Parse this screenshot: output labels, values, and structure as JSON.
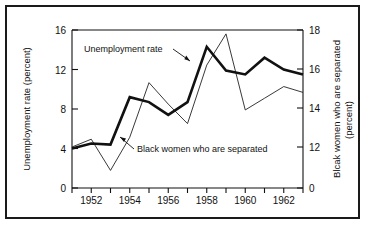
{
  "figure": {
    "background_color": "#ffffff",
    "frame_color": "#1a1a1a"
  },
  "chart_data": {
    "type": "line",
    "title": "",
    "xlabel": "",
    "grid": false,
    "legend_position": "inline-annotations",
    "x": [
      1951,
      1952,
      1953,
      1954,
      1955,
      1956,
      1957,
      1958,
      1959,
      1960,
      1961,
      1962,
      1963
    ],
    "xlim": [
      1951,
      1963
    ],
    "x_tick_labels": [
      "1952",
      "1954",
      "1956",
      "1958",
      "1960",
      "1962"
    ],
    "x_major_ticks": [
      1952,
      1954,
      1956,
      1958,
      1960,
      1962
    ],
    "x_minor_ticks": [
      1951,
      1953,
      1955,
      1957,
      1959,
      1961,
      1963
    ],
    "left_axis": {
      "label_line1": "Unemployment rate (percent)",
      "ticks": [
        0,
        4,
        8,
        12,
        16
      ],
      "tick_labels": [
        "0",
        "4",
        "8",
        "12",
        "16"
      ],
      "ylim": [
        0,
        16
      ]
    },
    "right_axis": {
      "label_line1": "Blcak women who are separated",
      "label_line2": "(percent)",
      "ticks": [
        0,
        12,
        14,
        16,
        18
      ],
      "tick_labels": [
        "0",
        "12",
        "14",
        "16",
        "18"
      ],
      "ylim": [
        10,
        18
      ],
      "zero_break": true
    },
    "series": [
      {
        "name": "Unemployment rate",
        "axis": "left",
        "style": "thick",
        "color": "#111111",
        "values": [
          4.0,
          4.5,
          4.4,
          9.2,
          8.7,
          7.4,
          8.7,
          14.3,
          11.9,
          11.5,
          13.2,
          12.0,
          11.5
        ]
      },
      {
        "name": "Black women who are separated",
        "axis": "right",
        "style": "thin",
        "color": "#222222",
        "values": [
          12.0,
          12.4,
          10.8,
          12.5,
          15.3,
          14.2,
          13.2,
          16.2,
          17.8,
          13.9,
          14.5,
          15.1,
          14.8
        ]
      }
    ],
    "annotations": [
      {
        "text": "Unemployment rate",
        "target_series": "Unemployment rate"
      },
      {
        "text": "Black women who are separated",
        "target_series": "Black women who are separated"
      }
    ]
  }
}
